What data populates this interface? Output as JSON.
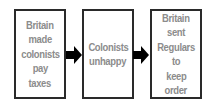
{
  "diagram": {
    "type": "flowchart",
    "direction": "left-to-right",
    "colors": {
      "border": "#2a2a2a",
      "text": "#8c8c8c",
      "arrow": "#000000",
      "background": "#ffffff"
    },
    "boxes": [
      {
        "id": "b1",
        "lines": [
          "Britain",
          "made",
          "colonists",
          "pay",
          "taxes"
        ]
      },
      {
        "id": "b2",
        "lines": [
          "Colonists",
          "unhappy"
        ]
      },
      {
        "id": "b3",
        "lines": [
          "Britain",
          "sent",
          "Regulars",
          "to",
          "keep",
          "order"
        ]
      }
    ],
    "arrows": [
      {
        "from": "b1",
        "to": "b2"
      },
      {
        "from": "b2",
        "to": "b3"
      }
    ]
  }
}
